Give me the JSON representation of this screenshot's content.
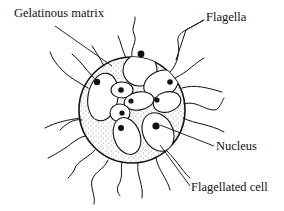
{
  "diagram": {
    "labels": {
      "gelatinous_matrix": "Gelatinous matrix",
      "flagella": "Flagella",
      "nucleus": "Nucleus",
      "flagellated_cell": "Flagellated cell"
    },
    "colors": {
      "ink": "#111111",
      "background": "#ffffff"
    }
  }
}
